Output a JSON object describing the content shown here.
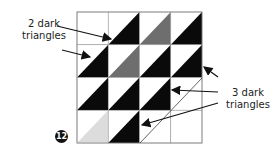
{
  "figure": {
    "badge_number": "12",
    "label_left": "2 dark triangles",
    "label_right": "3 dark triangles",
    "grid": {
      "rows": 4,
      "cols": 4,
      "cells": [
        [
          "white",
          "black",
          "gray",
          "black"
        ],
        [
          "black",
          "gray",
          "black",
          "black"
        ],
        [
          "black",
          "black",
          "black",
          "white"
        ],
        [
          "lightgray",
          "black",
          "white",
          "white"
        ]
      ]
    }
  }
}
